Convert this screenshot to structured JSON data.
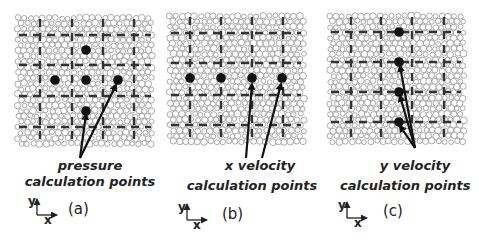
{
  "figure": {
    "colors": {
      "dot": "#111111",
      "grid": "#333333",
      "particle": "#888888",
      "text": "#222222"
    },
    "panels": [
      {
        "id": "a",
        "letter": "(a)",
        "caption_line1": "pressure",
        "caption_line2": "calculation points",
        "axis_x": "x",
        "axis_y": "y",
        "bounds": [
          15,
          15,
          155,
          145
        ],
        "vlines": [
          40,
          72,
          103,
          134
        ],
        "hlines": [
          35,
          65,
          96,
          127
        ],
        "dots": [
          [
            86,
            50
          ],
          [
            55,
            80
          ],
          [
            86,
            80
          ],
          [
            118,
            80
          ],
          [
            86,
            111
          ]
        ],
        "arrows": [
          [
            [
              80,
              158
            ],
            [
              86,
              114
            ]
          ],
          [
            [
              80,
              158
            ],
            [
              116,
              85
            ]
          ]
        ]
      },
      {
        "id": "b",
        "letter": "(b)",
        "caption_line1": "x velocity",
        "caption_line2": "calculation points",
        "axis_x": "x",
        "axis_y": "y",
        "bounds": [
          167,
          13,
          305,
          145
        ],
        "vlines": [
          190,
          221,
          252,
          283
        ],
        "hlines": [
          33,
          63,
          95,
          125
        ],
        "dots": [
          [
            190,
            78
          ],
          [
            221,
            78
          ],
          [
            252,
            78
          ],
          [
            282,
            78
          ]
        ],
        "arrows": [
          [
            [
              246,
              158
            ],
            [
              252,
              84
            ]
          ],
          [
            [
              262,
              158
            ],
            [
              281,
              84
            ]
          ]
        ]
      },
      {
        "id": "c",
        "letter": "(c)",
        "caption_line1": "y velocity",
        "caption_line2": "calculation points",
        "axis_x": "x",
        "axis_y": "y",
        "bounds": [
          327,
          13,
          465,
          145
        ],
        "vlines": [
          351,
          381,
          412,
          444
        ],
        "hlines": [
          32,
          62,
          92,
          122
        ],
        "dots": [
          [
            399,
            32
          ],
          [
            399,
            62
          ],
          [
            399,
            92
          ],
          [
            399,
            122
          ]
        ],
        "arrows": [
          [
            [
              415,
              148
            ],
            [
              400,
              66
            ]
          ],
          [
            [
              415,
              148
            ],
            [
              400,
              96
            ]
          ],
          [
            [
              415,
              148
            ],
            [
              400,
              126
            ]
          ]
        ]
      }
    ]
  }
}
